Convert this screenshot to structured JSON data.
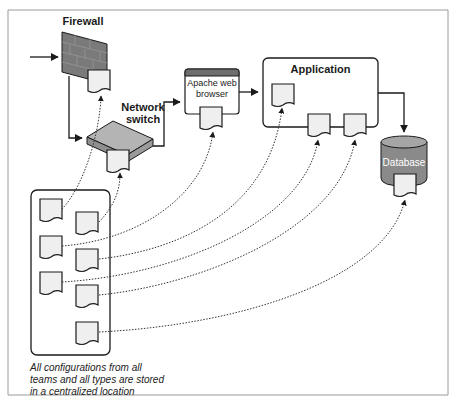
{
  "diagram": {
    "labels": {
      "firewall": "Firewall",
      "network_switch_line1": "Network",
      "network_switch_line2": "switch",
      "apache_line1": "Apache web",
      "apache_line2": "browser",
      "application": "Application",
      "database": "Database"
    },
    "caption": {
      "line1": "All configurations from all",
      "line2": "teams and all types are stored",
      "line3": "in a centralized location"
    },
    "colors": {
      "border": "#9a9a9a",
      "stroke": "#1a1a1a",
      "doc_fill": "#efefef",
      "firewall_fill": "#7a7a7a",
      "switch_fill": "#a9a9a9",
      "database_fill": "#8a8a8a",
      "apache_bar": "#6e6e6e"
    }
  }
}
